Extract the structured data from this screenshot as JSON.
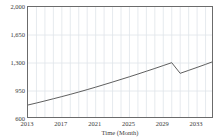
{
  "chart_data": {
    "type": "line",
    "title": "",
    "xlabel": "Time (Month)",
    "ylabel": "",
    "xlim": [
      2013,
      2035
    ],
    "ylim": [
      600,
      2000
    ],
    "grid": true,
    "legend": "none",
    "xticks": [
      "2013",
      "2017",
      "2021",
      "2025",
      "2029",
      "2033"
    ],
    "xtick_values": [
      2013,
      2017,
      2021,
      2025,
      2029,
      2033
    ],
    "yticks": [
      "600",
      "950",
      "1,300",
      "1,650",
      "2,000"
    ],
    "ytick_values": [
      600,
      950,
      1300,
      1650,
      2000
    ],
    "series": [
      {
        "name": "forecast",
        "color": "#4d4d4d",
        "x": [
          2013,
          2014,
          2015,
          2016,
          2017,
          2018,
          2019,
          2020,
          2021,
          2022,
          2023,
          2024,
          2025,
          2026,
          2027,
          2028,
          2029,
          2030,
          2031,
          2032,
          2033,
          2034,
          2035
        ],
        "values": [
          775,
          800,
          826,
          853,
          880,
          908,
          937,
          967,
          998,
          1030,
          1062,
          1095,
          1128,
          1162,
          1197,
          1232,
          1268,
          1304,
          1171,
          1208,
          1245,
          1283,
          1322
        ]
      }
    ]
  },
  "axes": {
    "x_title": "Time (Month)",
    "ticks_x": [
      {
        "label": "2013",
        "value": 2013
      },
      {
        "label": "2017",
        "value": 2017
      },
      {
        "label": "2021",
        "value": 2021
      },
      {
        "label": "2025",
        "value": 2025
      },
      {
        "label": "2029",
        "value": 2029
      },
      {
        "label": "2033",
        "value": 2033
      }
    ],
    "ticks_y": [
      {
        "label": "2,000",
        "value": 2000
      },
      {
        "label": "1,650",
        "value": 1650
      },
      {
        "label": "1,300",
        "value": 1300
      },
      {
        "label": "950",
        "value": 950
      },
      {
        "label": "600",
        "value": 600
      }
    ]
  },
  "style": {
    "line_color": "#4d4d4d",
    "grid_color": "#dfe4ea",
    "frame_color": "#6b6b6b",
    "background": "#ffffff",
    "text_color": "#3a3a3a"
  }
}
